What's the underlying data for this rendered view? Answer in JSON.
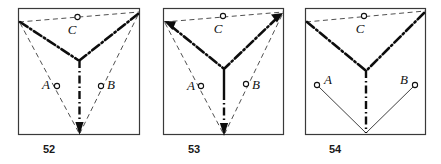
{
  "plate": {
    "background_color": "#ffffff",
    "ink_color": "#0d0d0d",
    "frame_color": "#3a3a3a"
  },
  "panels": [
    {
      "id": "52",
      "caption": "52",
      "labels": {
        "a": "A",
        "b": "B",
        "c": "C"
      },
      "markers": [
        "A",
        "B",
        "C"
      ],
      "description_keys": {
        "top_edge_style": "dashed-thin",
        "upper_y_style": "dash-dot-heavy",
        "lower_guides_style": "dashed-thin",
        "axis_style": "dash-dot-heavy",
        "axis_arrow": "down"
      }
    },
    {
      "id": "53",
      "caption": "53",
      "labels": {
        "a": "A",
        "b": "B",
        "c": "C"
      },
      "markers": [
        "A",
        "B",
        "C"
      ],
      "description_keys": {
        "top_edge_style": "dashed-thin",
        "upper_y_style": "dash-dot-heavy",
        "upper_arrows": "outward",
        "lower_guides_style": "dashed-thin",
        "axis_style": "solid-then-dash-dot",
        "axis_arrow": "down"
      }
    },
    {
      "id": "54",
      "caption": "54",
      "labels": {
        "a": "A",
        "b": "B",
        "c": "C"
      },
      "markers": [
        "A",
        "B",
        "C"
      ],
      "description_keys": {
        "top_edge_style": "dashed-thin",
        "upper_y_style": "dash-dot-heavy",
        "lower_guides_style": "solid-thin",
        "axis_style": "dash-dot-heavy",
        "axis_arrow": "none"
      }
    }
  ]
}
